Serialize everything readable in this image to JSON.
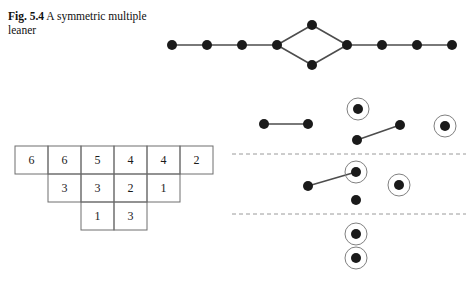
{
  "figure": {
    "caption_label": "Fig. 5.4",
    "caption_text": "A symmetric multiple leaner",
    "caption_full": "Fig. 5.4  A symmetric multiple leaner",
    "colors": {
      "node_fill": "#1a1a1a",
      "edge_stroke": "#4d4d4d",
      "ring_stroke": "#808080",
      "dashed_line": "#9a9a9a",
      "table_border": "#6e6e6e",
      "text": "#1a1a1a",
      "background": "#ffffff"
    },
    "geometry": {
      "node_radius": 5,
      "ring_radius": 11,
      "edge_width": 1.6,
      "cell_width": 33,
      "cell_height": 28
    }
  },
  "top_graph": {
    "name": "symmetric-multiple-leaner-graph",
    "description": "Path graph with a central 4-cycle (diamond)",
    "node_count": 12,
    "nodes": [
      {
        "id": "L1",
        "x": 172,
        "y": 45,
        "ringed": false
      },
      {
        "id": "L2",
        "x": 207,
        "y": 45,
        "ringed": false
      },
      {
        "id": "L3",
        "x": 242,
        "y": 45,
        "ringed": false
      },
      {
        "id": "L4",
        "x": 277,
        "y": 45,
        "ringed": false
      },
      {
        "id": "T",
        "x": 312,
        "y": 25,
        "ringed": false
      },
      {
        "id": "B",
        "x": 312,
        "y": 65,
        "ringed": false
      },
      {
        "id": "R4",
        "x": 347,
        "y": 45,
        "ringed": false
      },
      {
        "id": "R3",
        "x": 382,
        "y": 45,
        "ringed": false
      },
      {
        "id": "R2",
        "x": 417,
        "y": 45,
        "ringed": false
      },
      {
        "id": "R1",
        "x": 452,
        "y": 45,
        "ringed": false
      }
    ],
    "edges": [
      {
        "from": "L1",
        "to": "L2"
      },
      {
        "from": "L2",
        "to": "L3"
      },
      {
        "from": "L3",
        "to": "L4"
      },
      {
        "from": "L4",
        "to": "T"
      },
      {
        "from": "L4",
        "to": "B"
      },
      {
        "from": "T",
        "to": "R4"
      },
      {
        "from": "B",
        "to": "R4"
      },
      {
        "from": "R4",
        "to": "R3"
      },
      {
        "from": "R3",
        "to": "R2"
      },
      {
        "from": "R2",
        "to": "R1"
      }
    ]
  },
  "tableau": {
    "name": "young-tableau",
    "origin_x": 15,
    "origin_y": 146,
    "rows": [
      {
        "offset": 0,
        "values": [
          "6",
          "6",
          "5",
          "4",
          "4",
          "2"
        ]
      },
      {
        "offset": 1,
        "values": [
          "3",
          "3",
          "2",
          "1"
        ]
      },
      {
        "offset": 2,
        "values": [
          "1",
          "3"
        ]
      }
    ]
  },
  "right_diagram": {
    "name": "leaner-decomposition-diagram",
    "dashed_separators": [
      {
        "y": 154,
        "x1": 232,
        "x2": 466
      },
      {
        "y": 214,
        "x1": 232,
        "x2": 466
      }
    ],
    "bands": [
      {
        "id": "band-1",
        "nodes": [
          {
            "id": "b1n1",
            "x": 264,
            "y": 124,
            "ringed": false
          },
          {
            "id": "b1n2",
            "x": 308,
            "y": 124,
            "ringed": false
          },
          {
            "id": "b1n3",
            "x": 358,
            "y": 109,
            "ringed": true
          },
          {
            "id": "b1n4",
            "x": 357,
            "y": 140,
            "ringed": false
          },
          {
            "id": "b1n5",
            "x": 400,
            "y": 125,
            "ringed": false
          },
          {
            "id": "b1n6",
            "x": 445,
            "y": 126,
            "ringed": true
          }
        ],
        "edges": [
          {
            "from": "b1n1",
            "to": "b1n2"
          },
          {
            "from": "b1n4",
            "to": "b1n5"
          }
        ]
      },
      {
        "id": "band-2",
        "nodes": [
          {
            "id": "b2n1",
            "x": 308,
            "y": 186,
            "ringed": false
          },
          {
            "id": "b2n2",
            "x": 356,
            "y": 172,
            "ringed": true
          },
          {
            "id": "b2n3",
            "x": 399,
            "y": 185,
            "ringed": true
          },
          {
            "id": "b2n4",
            "x": 356,
            "y": 200,
            "ringed": false
          }
        ],
        "edges": [
          {
            "from": "b2n1",
            "to": "b2n2"
          }
        ]
      },
      {
        "id": "band-3",
        "nodes": [
          {
            "id": "b3n1",
            "x": 356,
            "y": 234,
            "ringed": true
          },
          {
            "id": "b3n2",
            "x": 356,
            "y": 258,
            "ringed": true
          }
        ],
        "edges": []
      }
    ]
  }
}
